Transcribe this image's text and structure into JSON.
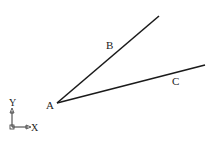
{
  "diagram": {
    "points": {
      "A": {
        "label": "A",
        "x": 57,
        "y": 103
      },
      "B_end": {
        "x": 159,
        "y": 16
      },
      "C_end": {
        "x": 205,
        "y": 65
      }
    },
    "lines": [
      {
        "name": "AB",
        "label": "B"
      },
      {
        "name": "AC",
        "label": "C"
      }
    ],
    "labels": {
      "A": "A",
      "B": "B",
      "C": "C"
    },
    "axis_icon": {
      "x_label": "X",
      "y_label": "Y"
    },
    "colors": {
      "line": "#1a1a1a",
      "background": "#ffffff"
    }
  }
}
